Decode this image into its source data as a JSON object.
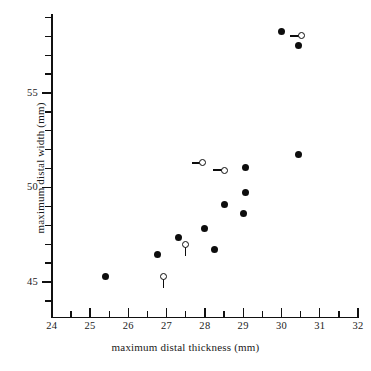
{
  "chart_data": {
    "type": "scatter",
    "title": "",
    "xlabel": "maximum distal thickness (mm)",
    "ylabel": "maximum distal width (mm)",
    "xlim": [
      24,
      32
    ],
    "ylim": [
      43.5,
      59.5
    ],
    "xticks": [
      24,
      25,
      26,
      27,
      28,
      29,
      30,
      31,
      32
    ],
    "xtick_labels": [
      "24",
      "25",
      "26",
      "27",
      "28",
      "29",
      "30",
      "31",
      "32"
    ],
    "xminor_step": 0.5,
    "yticks": [
      45,
      50,
      55
    ],
    "ytick_labels": [
      "45",
      "50",
      "55"
    ],
    "yminor_step": 1,
    "grid": false,
    "legend": null,
    "series": [
      {
        "name": "filled",
        "marker": "filled-circle",
        "color": "#0d0d0d",
        "points": [
          {
            "x": 25.4,
            "y": 45.28
          },
          {
            "x": 26.75,
            "y": 46.45
          },
          {
            "x": 27.32,
            "y": 47.35
          },
          {
            "x": 28.0,
            "y": 47.85
          },
          {
            "x": 28.25,
            "y": 46.7
          },
          {
            "x": 28.5,
            "y": 49.1
          },
          {
            "x": 29.0,
            "y": 48.6
          },
          {
            "x": 29.05,
            "y": 49.75
          },
          {
            "x": 29.05,
            "y": 51.05
          },
          {
            "x": 30.0,
            "y": 58.25
          },
          {
            "x": 30.45,
            "y": 51.72
          },
          {
            "x": 30.45,
            "y": 57.5
          }
        ]
      },
      {
        "name": "open",
        "marker": "open-circle",
        "color": "#0d0d0d",
        "points": [
          {
            "x": 26.92,
            "y": 45.28,
            "leader": "vertical"
          },
          {
            "x": 27.5,
            "y": 46.98,
            "leader": "vertical"
          },
          {
            "x": 27.95,
            "y": 51.3,
            "leader": "horizontal"
          },
          {
            "x": 28.5,
            "y": 50.92,
            "leader": "horizontal"
          },
          {
            "x": 30.52,
            "y": 58.02,
            "leader": "horizontal"
          }
        ]
      }
    ]
  },
  "labels": {
    "x_axis_title": "maximum distal thickness (mm)",
    "y_axis_title": "maximum distal width (mm)",
    "x_24": "24",
    "x_25": "25",
    "x_26": "26",
    "x_27": "27",
    "x_28": "28",
    "x_29": "29",
    "x_30": "30",
    "x_31": "31",
    "x_32": "32",
    "y_45": "45",
    "y_50": "50",
    "y_55": "55"
  },
  "colors": {
    "background": "#ffffff",
    "ink": "#111111",
    "marker": "#0d0d0d"
  }
}
